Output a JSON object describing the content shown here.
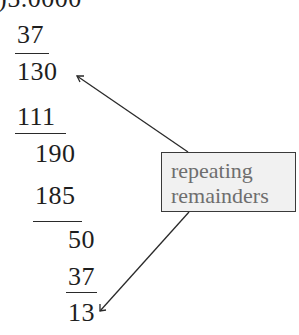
{
  "division": {
    "dividend_line": ")5.0000",
    "steps": [
      {
        "text": "37",
        "role": "subtrahend"
      },
      {
        "text": "130",
        "role": "remainder"
      },
      {
        "text": "111",
        "role": "subtrahend"
      },
      {
        "text": "190",
        "role": "remainder"
      },
      {
        "text": "185",
        "role": "subtrahend"
      },
      {
        "text": "50",
        "role": "remainder"
      },
      {
        "text": "37",
        "role": "subtrahend"
      },
      {
        "text": "13",
        "role": "remainder"
      }
    ]
  },
  "callout": {
    "line1": "repeating",
    "line2": "remainders",
    "points_to": [
      "130",
      "13"
    ]
  },
  "colors": {
    "text": "#1e1e1e",
    "callout_text": "#6e6e6e",
    "callout_fill": "#f1f1f1",
    "callout_border": "#3a3a3a"
  }
}
